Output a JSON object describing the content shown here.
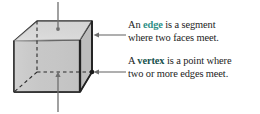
{
  "figure": {
    "name": "cube-diagram",
    "shape": "cube",
    "face_fill": "#c9c9c9",
    "top_face_fill": "#d5d5d5",
    "right_face_fill": "#b8b8b8",
    "outline_color": "#2a2a2a",
    "hidden_edge_style": "dashed",
    "markers": [
      {
        "name": "face-marker-dot",
        "label": ""
      },
      {
        "name": "vertex-marker-dot",
        "label": ""
      },
      {
        "name": "interior-marker-dot",
        "label": ""
      }
    ],
    "leader_lines": [
      {
        "name": "leader-top-face",
        "direction": "down"
      },
      {
        "name": "leader-edge-right",
        "direction": "left"
      },
      {
        "name": "leader-vertex-right",
        "direction": "left"
      },
      {
        "name": "leader-bottom-interior",
        "direction": "up"
      }
    ]
  },
  "callouts": {
    "edge": {
      "line1_pre": "An ",
      "term": "edge",
      "line1_post": " is a segment",
      "line2": "where two faces meet."
    },
    "vertex": {
      "line1_pre": "A ",
      "term": "vertex",
      "line1_post": " is a point where",
      "line2": "two or more edges meet."
    }
  },
  "colors": {
    "edge_term": "#2e8f86",
    "vertex_term": "#16514c",
    "body_text": "#1c1c1c",
    "background": "#ffffff"
  }
}
